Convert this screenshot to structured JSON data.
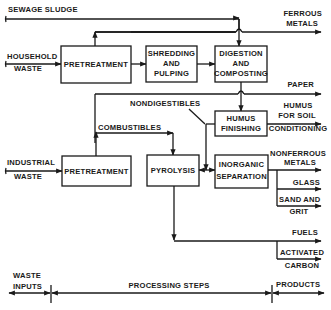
{
  "inputs": {
    "sewage_sludge": "SEWAGE SLUDGE",
    "household_waste": [
      "HOUSEHOLD",
      "WASTE"
    ],
    "industrial_waste": [
      "INDUSTRIAL",
      "WASTE"
    ]
  },
  "processes": {
    "pretreatment_household": "PRETREATMENT",
    "shredding": [
      "SHREDDING",
      "AND",
      "PULPING"
    ],
    "digestion": [
      "DIGESTION",
      "AND",
      "COMPOSTING"
    ],
    "humus_finishing": [
      "HUMUS",
      "FINISHING"
    ],
    "inorganic_separation": [
      "INORGANIC",
      "SEPARATION"
    ],
    "pretreatment_industrial": "PRETREATMENT",
    "pyrolysis": "PYROLYSIS"
  },
  "flows": {
    "nondigestibles": "NONDIGESTIBLES",
    "combustibles": "COMBUSTIBLES"
  },
  "products": {
    "ferrous_metals": [
      "FERROUS",
      "METALS"
    ],
    "paper": "PAPER",
    "humus_soil": [
      "HUMUS",
      "FOR SOIL",
      "CONDITIONING"
    ],
    "nonferrous_metals": [
      "NONFERROUS",
      "METALS"
    ],
    "glass": "GLASS",
    "sand_grit": [
      "SAND AND",
      "GRIT"
    ],
    "fuels": "FUELS",
    "activated_carbon": [
      "ACTIVATED",
      "CARBON"
    ]
  },
  "timeline": {
    "waste_inputs": [
      "WASTE",
      "INPUTS"
    ],
    "processing_steps": "PROCESSING STEPS",
    "products": "PRODUCTS"
  },
  "colors": {
    "ink": "#1a1a1a",
    "background": "#ffffff"
  }
}
